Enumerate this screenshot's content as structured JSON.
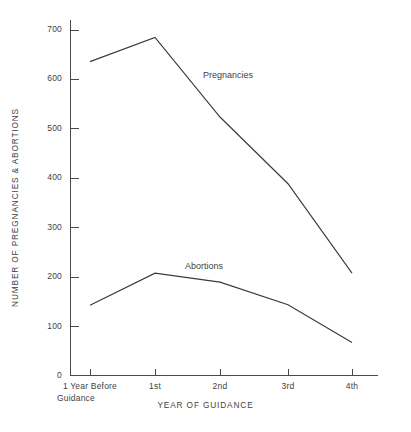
{
  "chart_data": {
    "type": "line",
    "title": "",
    "xlabel": "YEAR OF GUIDANCE",
    "ylabel": "NUMBER OF PREGNANCIES & ABORTIONS",
    "categories": [
      "1 Year Before Guidance",
      "1st",
      "2nd",
      "3rd",
      "4th"
    ],
    "category_lines": [
      [
        "1 Year Before",
        "Guidance"
      ],
      [
        "1st",
        ""
      ],
      [
        "2nd",
        ""
      ],
      [
        "3rd",
        ""
      ],
      [
        "4th",
        ""
      ]
    ],
    "ylim": [
      0,
      700
    ],
    "yticks": [
      0,
      100,
      200,
      300,
      400,
      500,
      600,
      700
    ],
    "ytick_labels": [
      "0",
      "100",
      "200",
      "300",
      "400",
      "500",
      "600",
      "700"
    ],
    "grid": false,
    "legend_position": "inline-annotation",
    "series": [
      {
        "name": "Pregnancies",
        "values": [
          635,
          684,
          523,
          388,
          207
        ],
        "color": "#3a3a3a",
        "label": "Pregnancies"
      },
      {
        "name": "Abortions",
        "values": [
          142,
          207,
          189,
          143,
          67
        ],
        "color": "#3a3a3a",
        "label": "Abortions"
      }
    ],
    "annotations": [
      {
        "text": "Pregnancies",
        "x_px": 203,
        "y_px": 70
      },
      {
        "text": "Abortions",
        "x_px": 185,
        "y_px": 261
      }
    ]
  }
}
